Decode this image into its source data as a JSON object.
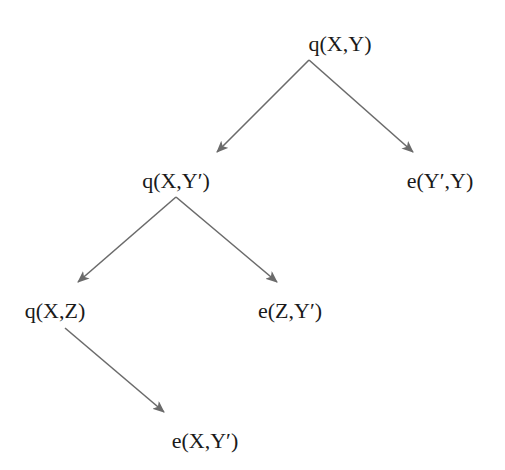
{
  "diagram": {
    "type": "derivation-tree",
    "edge_color": "#6b6b6b",
    "text_color": "#1a1a1a",
    "nodes": [
      {
        "id": "n0",
        "label": "q(X,Y)",
        "x": 340,
        "y": 44
      },
      {
        "id": "n1",
        "label": "q(X,Y′)",
        "x": 176,
        "y": 181
      },
      {
        "id": "n2",
        "label": "e(Y′,Y)",
        "x": 440,
        "y": 181
      },
      {
        "id": "n3",
        "label": "q(X,Z)",
        "x": 55,
        "y": 311
      },
      {
        "id": "n4",
        "label": "e(Z,Y′)",
        "x": 290,
        "y": 311
      },
      {
        "id": "n5",
        "label": "e(X,Y′)",
        "x": 205,
        "y": 441
      }
    ],
    "edges": [
      {
        "from": "n0",
        "to": "n1",
        "x1": 309,
        "y1": 60,
        "x2": 217,
        "y2": 152
      },
      {
        "from": "n0",
        "to": "n2",
        "x1": 309,
        "y1": 60,
        "x2": 413,
        "y2": 152
      },
      {
        "from": "n1",
        "to": "n3",
        "x1": 176,
        "y1": 197,
        "x2": 78,
        "y2": 282
      },
      {
        "from": "n1",
        "to": "n4",
        "x1": 176,
        "y1": 197,
        "x2": 277,
        "y2": 282
      },
      {
        "from": "n3",
        "to": "n5",
        "x1": 65,
        "y1": 328,
        "x2": 164,
        "y2": 412
      }
    ]
  }
}
